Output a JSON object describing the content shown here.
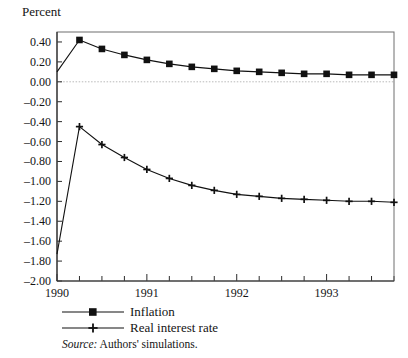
{
  "chart_data": {
    "type": "line",
    "title": "",
    "ylabel": "Percent",
    "xlabel": "",
    "ylim": [
      -2.0,
      0.5
    ],
    "xlim": [
      1990.0,
      1993.75
    ],
    "grid": false,
    "zero_reference_line": true,
    "legend_position": "below-axes",
    "ytick_labels": [
      "0.40",
      "0.20",
      "0.00",
      "–0.20",
      "–0.40",
      "–0.60",
      "–0.80",
      "–1.00",
      "–1.20",
      "–1.40",
      "–1.60",
      "–1.80",
      "–2.00"
    ],
    "ytick_values": [
      0.4,
      0.2,
      0.0,
      -0.2,
      -0.4,
      -0.6,
      -0.8,
      -1.0,
      -1.2,
      -1.4,
      -1.6,
      -1.8,
      -2.0
    ],
    "xtick_labels": [
      "1990",
      "1991",
      "1992",
      "1993"
    ],
    "xtick_values": [
      1990,
      1991,
      1992,
      1993
    ],
    "x": [
      1990.0,
      1990.25,
      1990.5,
      1990.75,
      1991.0,
      1991.25,
      1991.5,
      1991.75,
      1992.0,
      1992.25,
      1992.5,
      1992.75,
      1993.0,
      1993.25,
      1993.5,
      1993.75
    ],
    "series": [
      {
        "name": "Inflation",
        "marker": "square",
        "values": [
          0.1,
          0.42,
          0.33,
          0.27,
          0.22,
          0.18,
          0.15,
          0.13,
          0.11,
          0.1,
          0.09,
          0.08,
          0.08,
          0.07,
          0.07,
          0.07
        ],
        "first_point_has_marker": false
      },
      {
        "name": "Real interest rate",
        "marker": "plus",
        "values": [
          -1.73,
          -0.45,
          -0.63,
          -0.76,
          -0.88,
          -0.97,
          -1.04,
          -1.09,
          -1.13,
          -1.15,
          -1.17,
          -1.18,
          -1.19,
          -1.2,
          -1.2,
          -1.21
        ],
        "first_point_has_marker": false
      }
    ],
    "source_prefix": "Source:",
    "source_text": "Authors' simulations."
  }
}
